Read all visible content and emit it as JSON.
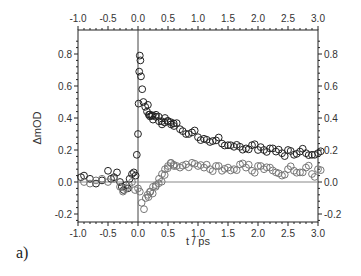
{
  "panel_label": "a)",
  "chart_data": {
    "type": "scatter",
    "title": "",
    "xlabel": "t / ps",
    "ylabel": "ΔmOD",
    "xlim": [
      -1.0,
      3.0
    ],
    "ylim": [
      -0.25,
      0.95
    ],
    "x_ticks": [
      "-1.0",
      "-0.5",
      "0.0",
      "0.5",
      "1.0",
      "1.5",
      "2.0",
      "2.5",
      "3.0"
    ],
    "y_ticks": [
      "-0.2",
      "0.0",
      "0.2",
      "0.4",
      "0.6",
      "0.8"
    ],
    "top_axis_mirrored": true,
    "right_axis_mirrored": true,
    "reference_lines": {
      "x": 0.0,
      "y": 0.0
    },
    "grid": false,
    "legend": null,
    "series": [
      {
        "name": "series-1",
        "marker": "open-circle",
        "color": "#222222",
        "x": [
          -0.95,
          -0.9,
          -0.8,
          -0.7,
          -0.6,
          -0.5,
          -0.45,
          -0.4,
          -0.35,
          -0.3,
          -0.27,
          -0.24,
          -0.2,
          -0.17,
          -0.14,
          -0.1,
          -0.07,
          -0.04,
          -0.02,
          0.0,
          0.01,
          0.02,
          0.03,
          0.04,
          0.05,
          0.07,
          0.09,
          0.12,
          0.15,
          0.18,
          0.2,
          0.25,
          0.3,
          0.35,
          0.4,
          0.45,
          0.5,
          0.55,
          0.6,
          0.7,
          0.8,
          0.9,
          1.0,
          1.1,
          1.2,
          1.3,
          1.4,
          1.5,
          1.6,
          1.7,
          1.8,
          1.9,
          2.0,
          2.1,
          2.2,
          2.3,
          2.4,
          2.5,
          2.6,
          2.7,
          2.8,
          2.9,
          3.0
        ],
        "y": [
          0.03,
          0.04,
          0.02,
          -0.01,
          0.01,
          0.07,
          0.02,
          0.03,
          0.06,
          0.0,
          -0.03,
          -0.05,
          -0.02,
          -0.04,
          0.02,
          0.05,
          0.06,
          0.04,
          0.17,
          0.3,
          0.49,
          0.69,
          0.79,
          0.76,
          0.66,
          0.58,
          0.5,
          0.47,
          0.44,
          0.42,
          0.41,
          0.39,
          0.42,
          0.38,
          0.36,
          0.4,
          0.38,
          0.36,
          0.35,
          0.33,
          0.3,
          0.31,
          0.28,
          0.27,
          0.25,
          0.26,
          0.24,
          0.23,
          0.22,
          0.22,
          0.21,
          0.23,
          0.2,
          0.2,
          0.21,
          0.19,
          0.18,
          0.2,
          0.17,
          0.19,
          0.18,
          0.17,
          0.18
        ]
      },
      {
        "name": "series-2",
        "marker": "open-circle",
        "color": "#777777",
        "x": [
          -0.9,
          -0.8,
          -0.7,
          -0.6,
          -0.5,
          -0.4,
          -0.3,
          -0.25,
          -0.2,
          -0.15,
          -0.1,
          -0.05,
          0.0,
          0.03,
          0.06,
          0.1,
          0.13,
          0.16,
          0.2,
          0.25,
          0.3,
          0.35,
          0.4,
          0.45,
          0.5,
          0.55,
          0.6,
          0.7,
          0.8,
          0.9,
          1.0,
          1.1,
          1.2,
          1.3,
          1.4,
          1.5,
          1.6,
          1.7,
          1.8,
          1.9,
          2.0,
          2.1,
          2.2,
          2.3,
          2.4,
          2.5,
          2.6,
          2.7,
          2.8,
          2.9,
          3.0
        ],
        "y": [
          0.0,
          -0.01,
          0.01,
          0.02,
          0.0,
          0.02,
          -0.03,
          -0.06,
          -0.04,
          -0.02,
          0.0,
          -0.05,
          -0.04,
          -0.06,
          -0.13,
          -0.17,
          -0.1,
          -0.08,
          -0.06,
          -0.03,
          -0.02,
          0.02,
          0.05,
          0.08,
          0.1,
          0.12,
          0.1,
          0.09,
          0.11,
          0.12,
          0.1,
          0.09,
          0.08,
          0.1,
          0.07,
          0.09,
          0.08,
          0.11,
          0.09,
          0.07,
          0.1,
          0.08,
          0.09,
          0.06,
          0.04,
          0.08,
          0.07,
          0.06,
          0.09,
          0.05,
          0.08
        ]
      }
    ]
  }
}
